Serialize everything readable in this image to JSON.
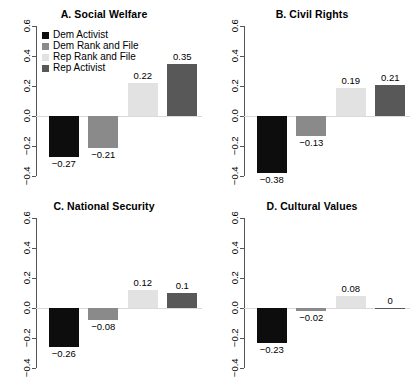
{
  "figure": {
    "background": "#ffffff",
    "axis_color": "#555555",
    "zero_line_color": "#d9d9d9"
  },
  "legend": {
    "position": "top-left of panel A",
    "entries": [
      {
        "label": "Dem Activist",
        "color": "#0d0d0d"
      },
      {
        "label": "Dem Rank and File",
        "color": "#8a8a8a"
      },
      {
        "label": "Rep Rank and File",
        "color": "#e2e2e2"
      },
      {
        "label": "Rep Activist",
        "color": "#585858"
      }
    ]
  },
  "axis": {
    "ticks": [
      "0.6",
      "0.4",
      "0.2",
      "0.0",
      "-0.2",
      "-0.4"
    ],
    "tick_values": [
      0.6,
      0.4,
      0.2,
      0.0,
      -0.2,
      -0.4
    ],
    "ylim": [
      -0.4,
      0.6
    ]
  },
  "chart_data": {
    "type": "bar",
    "title": "",
    "xlabel": "",
    "ylabel": "",
    "ylim": [
      -0.4,
      0.6
    ],
    "grid": false,
    "legend_position": "top-left",
    "categories": [
      "Dem Activist",
      "Dem Rank and File",
      "Rep Rank and File",
      "Rep Activist"
    ],
    "colors": [
      "#0d0d0d",
      "#8a8a8a",
      "#e2e2e2",
      "#585858"
    ],
    "yticks": [
      0.6,
      0.4,
      0.2,
      0.0,
      -0.2,
      -0.4
    ],
    "panels": [
      {
        "id": "a",
        "title": "A. Social Welfare",
        "values": [
          -0.27,
          -0.21,
          0.22,
          0.35
        ],
        "labels": [
          "−0.27",
          "−0.21",
          "0.22",
          "0.35"
        ]
      },
      {
        "id": "b",
        "title": "B. Civil Rights",
        "values": [
          -0.38,
          -0.13,
          0.19,
          0.21
        ],
        "labels": [
          "−0.38",
          "−0.13",
          "0.19",
          "0.21"
        ]
      },
      {
        "id": "c",
        "title": "C. National Security",
        "values": [
          -0.26,
          -0.08,
          0.12,
          0.1
        ],
        "labels": [
          "−0.26",
          "−0.08",
          "0.12",
          "0.1"
        ]
      },
      {
        "id": "d",
        "title": "D. Cultural Values",
        "values": [
          -0.23,
          -0.02,
          0.08,
          0
        ],
        "labels": [
          "−0.23",
          "−0.02",
          "0.08",
          "0"
        ]
      }
    ]
  }
}
